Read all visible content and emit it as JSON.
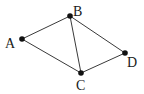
{
  "diagram": {
    "type": "graph",
    "nodes": [
      {
        "id": "A",
        "label": "A",
        "x": 22,
        "y": 39,
        "label_x": 5,
        "label_y": 48
      },
      {
        "id": "B",
        "label": "B",
        "x": 70,
        "y": 16,
        "label_x": 73,
        "label_y": 16
      },
      {
        "id": "C",
        "label": "C",
        "x": 81,
        "y": 73,
        "label_x": 76,
        "label_y": 90
      },
      {
        "id": "D",
        "label": "D",
        "x": 125,
        "y": 53,
        "label_x": 127,
        "label_y": 67
      }
    ],
    "edges": [
      {
        "from": "A",
        "to": "B"
      },
      {
        "from": "A",
        "to": "C"
      },
      {
        "from": "B",
        "to": "C"
      },
      {
        "from": "B",
        "to": "D"
      },
      {
        "from": "C",
        "to": "D"
      }
    ],
    "colors": {
      "edge": "#3a3a3a",
      "node": "#111111",
      "label": "#1a1a1a"
    }
  }
}
